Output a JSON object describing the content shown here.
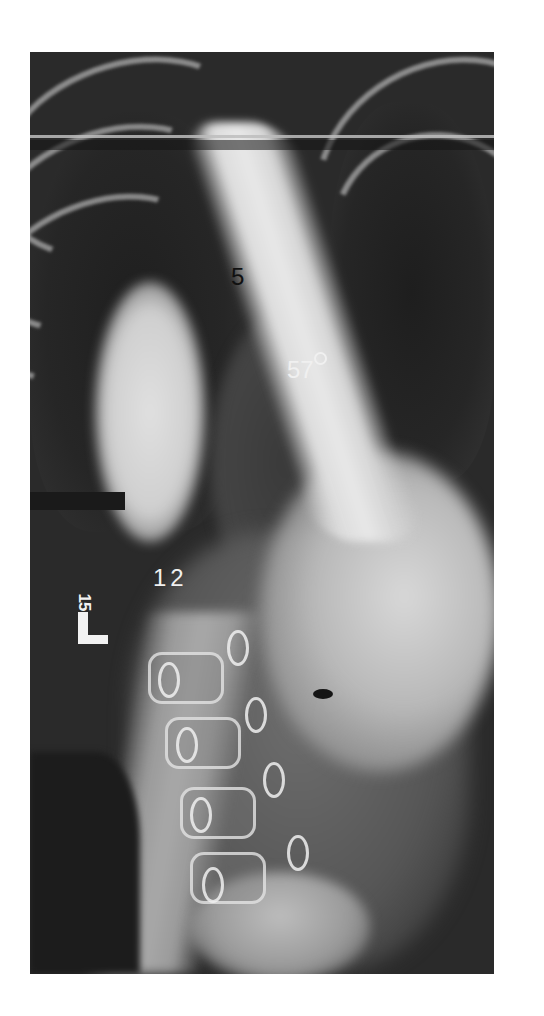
{
  "figure": {
    "type": "radiograph",
    "background": "#ffffff",
    "frame": {
      "left": 30,
      "top": 52,
      "width": 464,
      "height": 922
    }
  },
  "annotations": {
    "upper_vertebra_label": "5",
    "cobb_angle_value": "57",
    "cobb_angle_symbol": "degree",
    "lower_vertebra_label": "12",
    "side_marker_letter": "L",
    "side_marker_number": "15"
  },
  "colors": {
    "dark_label": "#111111",
    "light_label": "#f0f0f0",
    "film_dark": "#2a2a2a"
  }
}
